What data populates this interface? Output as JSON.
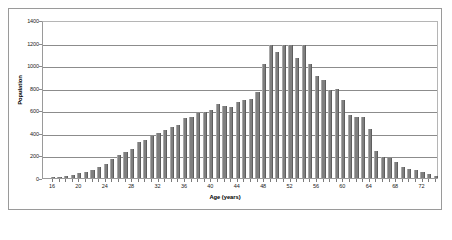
{
  "chart_data": {
    "type": "bar",
    "title": "",
    "xlabel": "Age (years)",
    "ylabel": "Population",
    "xlim": [
      15,
      75
    ],
    "ylim": [
      0,
      1400
    ],
    "ytick_step": 200,
    "yticks": [
      0,
      200,
      400,
      600,
      800,
      1000,
      1200,
      1400
    ],
    "xticks": [
      16,
      20,
      24,
      28,
      32,
      36,
      40,
      44,
      48,
      52,
      56,
      60,
      64,
      68,
      72
    ],
    "grid": true,
    "legend": false,
    "bar_color": "#7f7f7f",
    "categories": [
      16,
      17,
      18,
      19,
      20,
      21,
      22,
      23,
      24,
      25,
      26,
      27,
      28,
      29,
      30,
      31,
      32,
      33,
      34,
      35,
      36,
      37,
      38,
      39,
      40,
      41,
      42,
      43,
      44,
      45,
      46,
      47,
      48,
      49,
      50,
      51,
      52,
      53,
      54,
      55,
      56,
      57,
      58,
      59,
      60,
      61,
      62,
      63,
      64,
      65,
      66,
      67,
      68,
      69,
      70,
      71,
      72,
      73,
      74
    ],
    "values": [
      5,
      10,
      20,
      25,
      45,
      50,
      75,
      95,
      120,
      165,
      200,
      230,
      255,
      320,
      340,
      375,
      400,
      425,
      450,
      470,
      530,
      545,
      575,
      585,
      600,
      660,
      640,
      630,
      670,
      690,
      700,
      760,
      1010,
      1180,
      1120,
      1180,
      1180,
      1060,
      1180,
      1010,
      905,
      870,
      780,
      790,
      690,
      555,
      545,
      540,
      430,
      240,
      190,
      175,
      145,
      100,
      80,
      70,
      50,
      35,
      20
    ]
  }
}
